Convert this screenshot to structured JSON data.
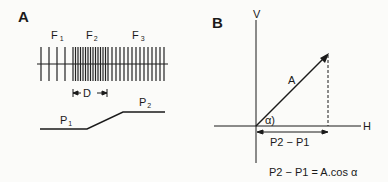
{
  "panel_a": {
    "label": "A",
    "regions": [
      {
        "name": "F",
        "sub": "1"
      },
      {
        "name": "F",
        "sub": "2"
      },
      {
        "name": "F",
        "sub": "3"
      }
    ],
    "distance_label": "D",
    "levels": [
      {
        "name": "P",
        "sub": "1"
      },
      {
        "name": "P",
        "sub": "2"
      }
    ]
  },
  "panel_b": {
    "label": "B",
    "axis_v": "V",
    "axis_h": "H",
    "vector_label": "A",
    "angle_label": "α)",
    "projection_label": "P2 − P1",
    "equation": "P2 − P1 = A.cos α"
  }
}
